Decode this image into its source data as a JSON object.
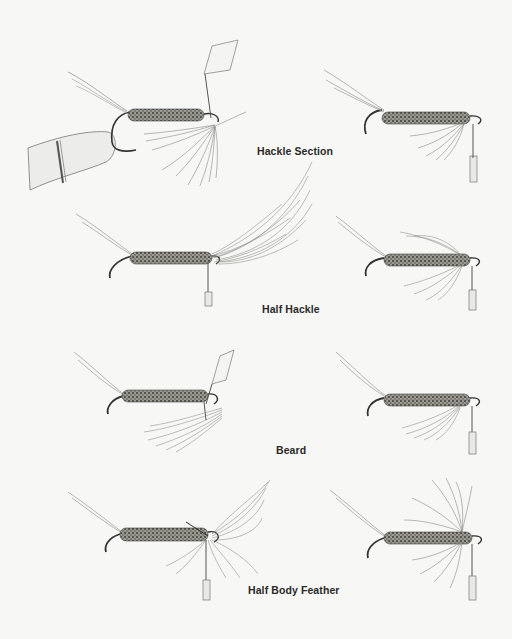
{
  "figure": {
    "captions": [
      {
        "id": "hackle-section",
        "label": "Hackle Section"
      },
      {
        "id": "half-hackle",
        "label": "Half Hackle"
      },
      {
        "id": "beard",
        "label": "Beard"
      },
      {
        "id": "half-body-feather",
        "label": "Half Body Feather"
      }
    ],
    "rows": [
      {
        "caption": "Hackle Section",
        "left": "fly in vise with hackle section tied under hook using bobbin",
        "right": "finished fly with hackle section"
      },
      {
        "caption": "Half Hackle",
        "left": "fly with long half hackle feather attached",
        "right": "finished fly with half hackle"
      },
      {
        "caption": "Beard",
        "left": "fly with beard fibers tied under hook using bobbin",
        "right": "finished fly with beard"
      },
      {
        "caption": "Half Body Feather",
        "left": "fly with half body feather attached",
        "right": "finished fly with half body feather hackle"
      }
    ]
  },
  "colors": {
    "background": "#f7f7f5",
    "ink": "#2a2a2a",
    "body_dark": "#4a4a44",
    "fiber": "#8a8a84"
  }
}
